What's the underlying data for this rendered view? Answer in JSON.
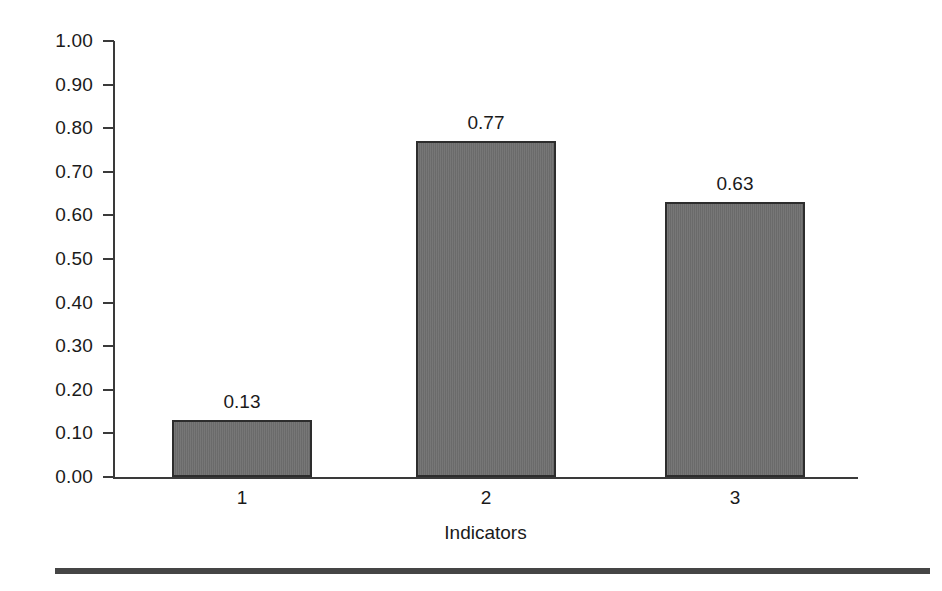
{
  "chart_data": {
    "type": "bar",
    "title": "",
    "subtitle": "",
    "xlabel": "Indicators",
    "ylabel": "",
    "categories": [
      "1",
      "2",
      "3"
    ],
    "values": [
      0.13,
      0.77,
      0.63
    ],
    "data_labels": [
      "0.13",
      "0.77",
      "0.63"
    ],
    "ylim": [
      0.0,
      1.0
    ],
    "xlim": null,
    "ytick_labels": [
      "1.00",
      "0.90",
      "0.80",
      "0.70",
      "0.60",
      "0.50",
      "0.40",
      "0.30",
      "0.20",
      "0.10",
      "0.00"
    ],
    "ytick_values": [
      1.0,
      0.9,
      0.8,
      0.7,
      0.6,
      0.5,
      0.4,
      0.3,
      0.2,
      0.1,
      0.0
    ],
    "xtick_labels": [
      "1",
      "2",
      "3"
    ],
    "grid": false,
    "legend": false,
    "legend_position": "none",
    "bar_fill_color": "#6f6f6f",
    "bar_border_color": "#2d2d2d",
    "axis_color": "#3a3a3a",
    "text_color": "#1a1a1a",
    "background_color": "#ffffff",
    "annotations": []
  },
  "figure": {
    "bottom_rule_color": "#454545"
  }
}
